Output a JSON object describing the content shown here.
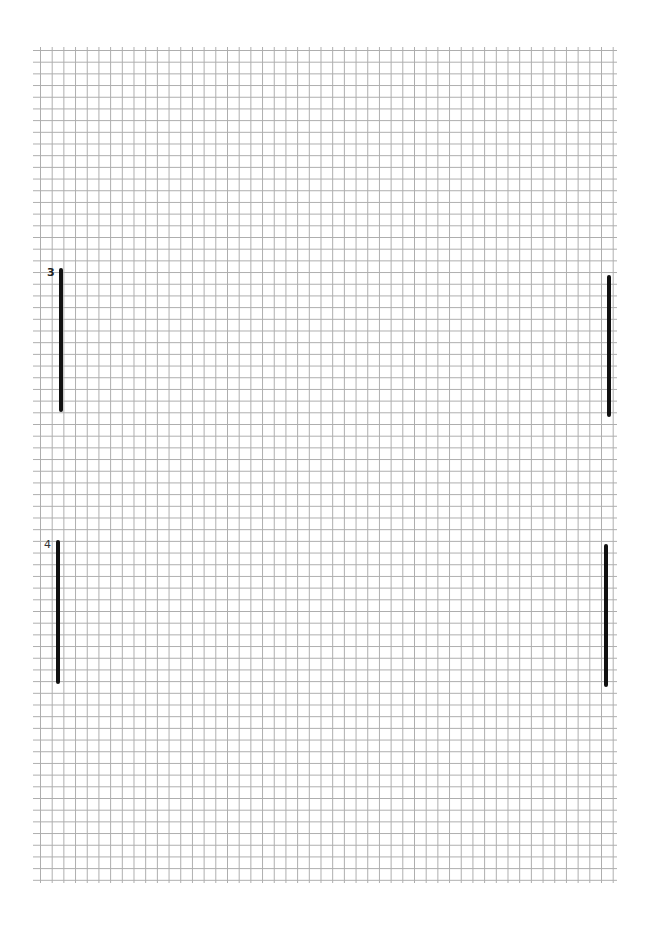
{
  "page": {
    "type": "graph-paper",
    "background_color": "#ffffff",
    "grid_line_color": "#a9a9a9"
  },
  "markers": [
    {
      "label": "3",
      "left_bar": {
        "x": 60,
        "y_top": 268,
        "y_bottom": 411
      },
      "right_bar": {
        "x": 608,
        "y_top": 275,
        "y_bottom": 416
      }
    },
    {
      "label": "4",
      "left_bar": {
        "x": 57,
        "y_top": 540,
        "y_bottom": 683
      },
      "right_bar": {
        "x": 605,
        "y_top": 544,
        "y_bottom": 686
      }
    }
  ]
}
